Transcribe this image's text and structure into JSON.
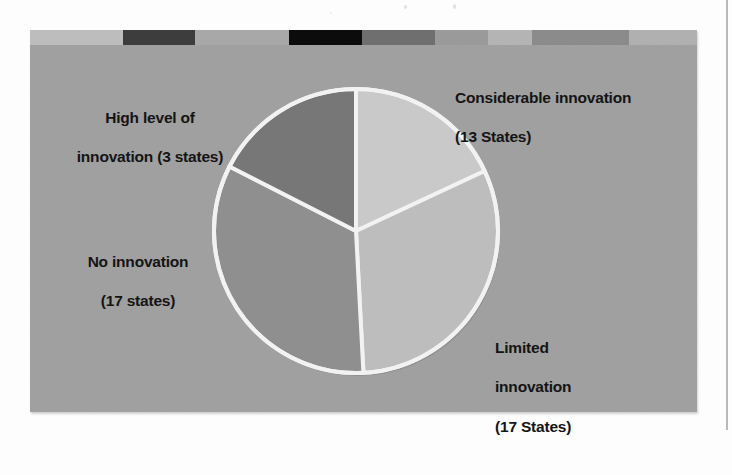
{
  "figure": {
    "background_color": "#9e9e9e",
    "page_color": "#fdfdfd",
    "divider_color": "#f2f2f2"
  },
  "decor_bar": {
    "name": "decorative-rule",
    "segments": [
      {
        "color": "#bdbdbd",
        "width": 93
      },
      {
        "color": "#3d3d3d",
        "width": 72
      },
      {
        "color": "#a8a8a8",
        "width": 94
      },
      {
        "color": "#0c0c0c",
        "width": 73
      },
      {
        "color": "#6f6f6f",
        "width": 73
      },
      {
        "color": "#9a9a9a",
        "width": 53
      },
      {
        "color": "#b4b4b4",
        "width": 44
      },
      {
        "color": "#8b8b8b",
        "width": 97
      },
      {
        "color": "#b0b0b0",
        "width": 68
      }
    ]
  },
  "chart_data": {
    "type": "pie",
    "title": "",
    "subtitle": "",
    "xlabel": "",
    "ylabel": "",
    "legend_position": "none",
    "grid": false,
    "unit": "States",
    "total": 50,
    "center": {
      "x": 326,
      "y": 201
    },
    "radius": 142,
    "categories": [
      "Considerable innovation",
      "Limited innovation",
      "No innovation",
      "High level of innovation"
    ],
    "values": [
      13,
      17,
      17,
      3
    ],
    "slices": [
      {
        "name": "considerable-innovation",
        "label": "Considerable innovation",
        "count_label": "(13 States)",
        "value": 13,
        "color": "#c9c9c9",
        "start_angle": 0,
        "end_angle": 65
      },
      {
        "name": "limited-innovation",
        "label": "Limited innovation",
        "count_label": "(17 States)",
        "value": 17,
        "color": "#bdbdbd",
        "start_angle": 65,
        "end_angle": 177
      },
      {
        "name": "no-innovation",
        "label": "No innovation",
        "count_label": "(17 states)",
        "value": 17,
        "color": "#8f8f8f",
        "start_angle": 177,
        "end_angle": 297
      },
      {
        "name": "high-level-innovation",
        "label": "High level of innovation",
        "count_label": "(3 states)",
        "value": 3,
        "color": "#777777",
        "start_angle": 297,
        "end_angle": 360
      }
    ]
  },
  "labels": {
    "considerable": {
      "line1": "Considerable innovation",
      "line2": "(13 States)"
    },
    "high_level": {
      "line1": "High level of",
      "line2": "innovation (3 states)"
    },
    "no_innovation": {
      "line1": "No innovation",
      "line2": "(17 states)"
    },
    "limited": {
      "line1": "Limited",
      "line2": "innovation",
      "line3": "(17 States)"
    }
  }
}
